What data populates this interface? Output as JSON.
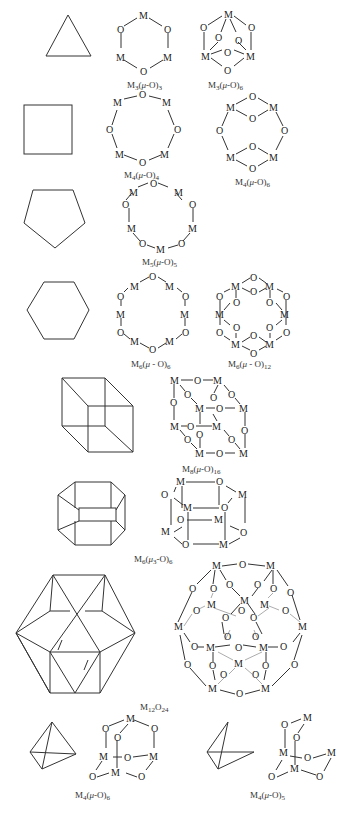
{
  "figure": {
    "rows": [
      {
        "polyhedron": "triangle",
        "clusters": [
          {
            "label": "M3(μ-O)3",
            "base": "M",
            "sub": "3",
            "mid": "(μ-O)",
            "sub2": "3"
          },
          {
            "label": "M3(μ-O)6",
            "base": "M",
            "sub": "3",
            "mid": "(μ-O)",
            "sub2": "6"
          }
        ]
      },
      {
        "polyhedron": "square",
        "clusters": [
          {
            "label": "M4(μ-O)4",
            "base": "M",
            "sub": "4",
            "mid": "(μ-O)",
            "sub2": "4"
          },
          {
            "label": "M4(μ-O)6",
            "base": "M",
            "sub": "4",
            "mid": "(μ-O)",
            "sub2": "6"
          }
        ]
      },
      {
        "polyhedron": "pentagon",
        "clusters": [
          {
            "label": "M5(μ-O)5",
            "base": "M",
            "sub": "5",
            "mid": "(μ-O)",
            "sub2": "5"
          }
        ]
      },
      {
        "polyhedron": "hexagon",
        "clusters": [
          {
            "label": "M6(μ-O)6",
            "base": "M",
            "sub": "6",
            "mid": "(μ-O)",
            "sub2": "6"
          },
          {
            "label": "M6(μ-O)12",
            "base": "M",
            "sub": "6",
            "mid": "(μ-O)",
            "sub2": "12"
          }
        ]
      },
      {
        "polyhedron": "cube",
        "clusters": [
          {
            "label": "M8(μ-O)16",
            "base": "M",
            "sub": "8",
            "mid": "(μ-O)",
            "sub2": "16"
          }
        ]
      },
      {
        "polyhedron": "hexagonal-prism",
        "clusters": [
          {
            "label": "M6(μ3-O)6",
            "base": "M",
            "sub": "6",
            "mid": "(μ3-O)",
            "sub2": "6"
          }
        ]
      },
      {
        "polyhedron": "cuboctahedron",
        "clusters": [
          {
            "label": "M12O24",
            "base": "M",
            "sub": "12",
            "mid": "O",
            "sub2": "24"
          }
        ]
      },
      {
        "polyhedron": "tetrahedron",
        "clusters": [
          {
            "label": "M4(μ-O)6",
            "base": "M",
            "sub": "4",
            "mid": "(μ-O)",
            "sub2": "6"
          }
        ]
      },
      {
        "polyhedron": "open-tetrahedron",
        "clusters": [
          {
            "label": "M4(μ-O)5",
            "base": "M",
            "sub": "4",
            "mid": "(μ-O)",
            "sub2": "5"
          }
        ]
      }
    ],
    "atoms": {
      "metal": "M",
      "oxygen": "O"
    }
  }
}
